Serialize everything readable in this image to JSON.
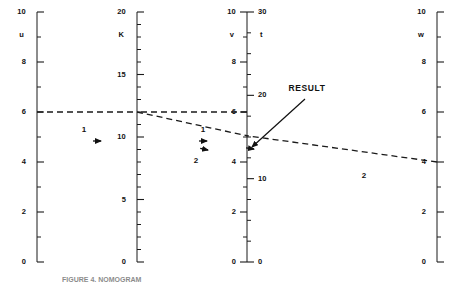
{
  "figure": {
    "type": "nomogram",
    "caption": "FIGURE 4. NOMOGRAM",
    "result_label": "RESULT",
    "step_labels": [
      "1",
      "1",
      "2",
      "2"
    ]
  },
  "chart_data": {
    "type": "line",
    "title": "",
    "subtitle": "",
    "xlabel": "",
    "ylabel": "",
    "grid": false,
    "legend": null,
    "axes": [
      {
        "name": "u",
        "label": "u",
        "x_px": 37,
        "label_side": "left",
        "tick_side": "right",
        "min": 0,
        "max": 10,
        "major_step": 2,
        "minor_step": 1,
        "top_px": 12,
        "bottom_px": 262,
        "tick_labels": [
          "0",
          "2",
          "4",
          "6",
          "8",
          "10"
        ],
        "tick_values": [
          0,
          2,
          4,
          6,
          8,
          10
        ]
      },
      {
        "name": "K",
        "label": "K",
        "x_px": 137,
        "label_side": "left",
        "tick_side": "right",
        "min": 0,
        "max": 20,
        "major_step": 5,
        "minor_step": 1,
        "top_px": 12,
        "bottom_px": 262,
        "tick_labels": [
          "0",
          "5",
          "10",
          "15",
          "20"
        ],
        "tick_values": [
          0,
          5,
          10,
          15,
          20
        ]
      },
      {
        "name": "v",
        "label": "v",
        "x_px": 247,
        "label_side": "left",
        "tick_side": "left",
        "min": 0,
        "max": 10,
        "major_step": 2,
        "minor_step": 1,
        "top_px": 12,
        "bottom_px": 262,
        "tick_labels": [
          "0",
          "2",
          "4",
          "6",
          "8",
          "10"
        ],
        "tick_values": [
          0,
          2,
          4,
          6,
          8,
          10
        ]
      },
      {
        "name": "t",
        "label": "t",
        "x_px": 247,
        "label_side": "right",
        "tick_side": "right",
        "min": 0,
        "max": 30,
        "major_step": 10,
        "minor_step": 2.5,
        "top_px": 12,
        "bottom_px": 262,
        "tick_labels": [
          "0",
          "10",
          "20",
          "30"
        ],
        "tick_values": [
          0,
          10,
          20,
          30
        ]
      },
      {
        "name": "w",
        "label": "w",
        "x_px": 437,
        "label_side": "left",
        "tick_side": "right",
        "min": 0,
        "max": 10,
        "major_step": 2,
        "minor_step": 1,
        "top_px": 12,
        "bottom_px": 262,
        "tick_labels": [
          "0",
          "2",
          "4",
          "6",
          "8",
          "10"
        ],
        "tick_values": [
          0,
          2,
          4,
          6,
          8,
          10
        ]
      }
    ],
    "construction_lines": [
      {
        "step": "1",
        "style": "dashed",
        "from": {
          "axis": "u",
          "value": 6
        },
        "to": {
          "axis": "K",
          "value": 12
        },
        "arrow": "forward",
        "arrow_at_px": {
          "x": 101,
          "y": 141
        },
        "label": "1",
        "label_px": {
          "x": 84,
          "y": 130
        }
      },
      {
        "step": "1",
        "style": "dashed",
        "from": {
          "axis": "v",
          "value": 6
        },
        "to": {
          "axis": "K",
          "value": 12
        },
        "arrow": "backward",
        "arrow_at_px": {
          "x": 207,
          "y": 141
        },
        "label": "1",
        "label_px": {
          "x": 203,
          "y": 130
        }
      },
      {
        "step": "2",
        "style": "dashed",
        "from": {
          "axis": "K",
          "value": 12
        },
        "to": {
          "axis": "v",
          "value": 5.05
        },
        "arrow": "forward",
        "arrow_at_px": {
          "x": 208,
          "y": 150
        },
        "label": "2",
        "label_px": {
          "x": 196,
          "y": 161
        }
      },
      {
        "step": "2",
        "style": "dashed",
        "from": {
          "axis": "w",
          "value": 4
        },
        "to": {
          "axis": "v",
          "value": 5.05
        },
        "arrow": "backward",
        "arrow_at_px": {
          "x": 254,
          "y": 149
        },
        "label": "2",
        "label_px": {
          "x": 364,
          "y": 176
        }
      }
    ],
    "result": {
      "label": "RESULT",
      "label_px": {
        "x": 307,
        "y": 88
      },
      "points_to": {
        "axis": "v",
        "value": 5.05
      },
      "leader_from_px": {
        "x": 305,
        "y": 99
      },
      "leader_to_px": {
        "x": 252,
        "y": 147
      }
    },
    "values": {
      "u": 6,
      "K": 12,
      "v": 5.05,
      "w": 4
    }
  }
}
